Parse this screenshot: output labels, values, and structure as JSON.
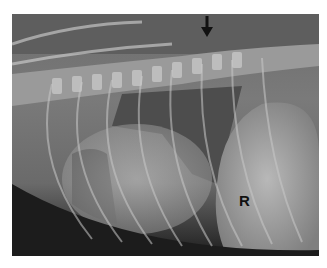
{
  "image": {
    "description": "Lateral thoracic radiograph",
    "annotations": {
      "arrow": "down-arrow",
      "label": "R"
    }
  }
}
